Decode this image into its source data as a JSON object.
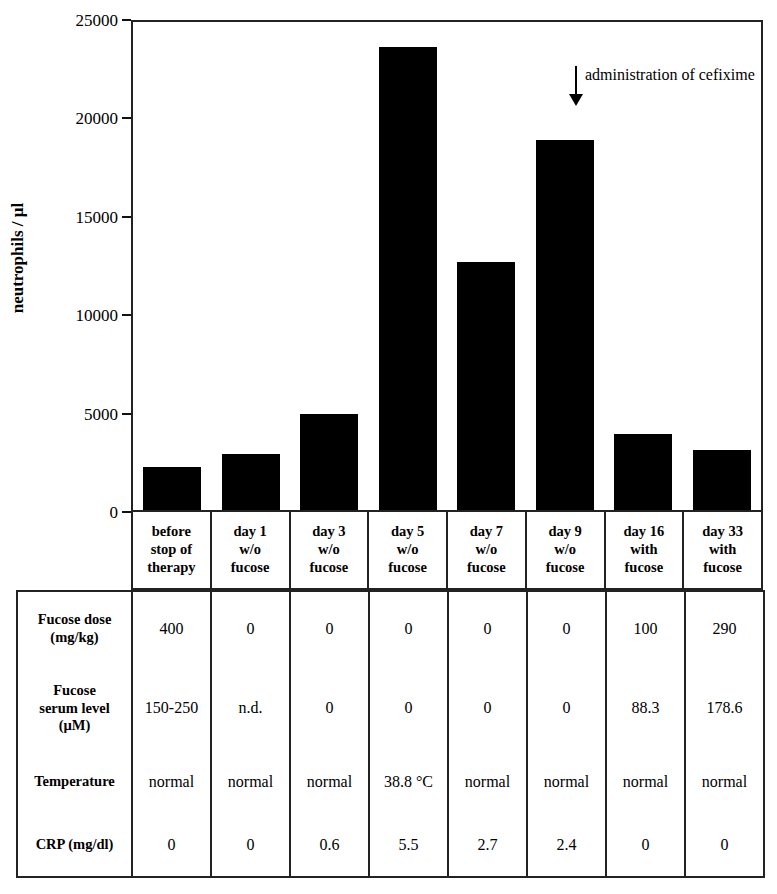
{
  "chart_data": {
    "type": "bar",
    "title": "",
    "xlabel": "",
    "ylabel": "neutrophils / µl",
    "ylim": [
      0,
      25000
    ],
    "ytick_labels": [
      "0",
      "5000",
      "10000",
      "15000",
      "20000",
      "25000"
    ],
    "yticks": [
      0,
      5000,
      10000,
      15000,
      20000,
      25000
    ],
    "grid": false,
    "legend": "none",
    "bar_color": "#000000",
    "categories": [
      "before stop of therapy",
      "day 1 w/o fucose",
      "day 3 w/o fucose",
      "day 5 w/o fucose",
      "day 7 w/o fucose",
      "day 9 w/o fucose",
      "day 16 with fucose",
      "day 33 with fucose"
    ],
    "values": [
      2200,
      2850,
      4900,
      23700,
      12700,
      18950,
      3900,
      3050
    ],
    "annotations": [
      {
        "text": "administration of cefixime",
        "marker": "down-arrow",
        "at_category": "day 5 w/o fucose"
      }
    ]
  },
  "axis": {
    "ylabel": "neutrophils / µl",
    "ticks": [
      {
        "value": 25000,
        "label": "25000"
      },
      {
        "value": 20000,
        "label": "20000"
      },
      {
        "value": 15000,
        "label": "15000"
      },
      {
        "value": 10000,
        "label": "10000"
      },
      {
        "value": 5000,
        "label": "5000"
      },
      {
        "value": 0,
        "label": "0"
      }
    ]
  },
  "annotation": {
    "text": "administration of cefixime"
  },
  "categories": [
    {
      "line1": "before",
      "line2": "stop of",
      "line3": "therapy"
    },
    {
      "line1": "day 1",
      "line2": "w/o",
      "line3": "fucose"
    },
    {
      "line1": "day 3",
      "line2": "w/o",
      "line3": "fucose"
    },
    {
      "line1": "day 5",
      "line2": "w/o",
      "line3": "fucose"
    },
    {
      "line1": "day 7",
      "line2": "w/o",
      "line3": "fucose"
    },
    {
      "line1": "day 9",
      "line2": "w/o",
      "line3": "fucose"
    },
    {
      "line1": "day 16",
      "line2": "with",
      "line3": "fucose"
    },
    {
      "line1": "day 33",
      "line2": "with",
      "line3": "fucose"
    }
  ],
  "table": {
    "row_labels": [
      {
        "line1": "Fucose dose",
        "line2": "(mg/kg)",
        "line3": ""
      },
      {
        "line1": "Fucose",
        "line2": "serum level",
        "line3": "(µM)"
      },
      {
        "line1": "Temperature",
        "line2": "",
        "line3": ""
      },
      {
        "line1": "CRP (mg/dl)",
        "line2": "",
        "line3": ""
      }
    ],
    "rows": [
      {
        "name": "Fucose dose (mg/kg)",
        "values": [
          "400",
          "0",
          "0",
          "0",
          "0",
          "0",
          "100",
          "290"
        ]
      },
      {
        "name": "Fucose serum level (µM)",
        "values": [
          "150-250",
          "n.d.",
          "0",
          "0",
          "0",
          "0",
          "88.3",
          "178.6"
        ]
      },
      {
        "name": "Temperature",
        "values": [
          "normal",
          "normal",
          "normal",
          "38.8 °C",
          "normal",
          "normal",
          "normal",
          "normal"
        ]
      },
      {
        "name": "CRP (mg/dl)",
        "values": [
          "0",
          "0",
          "0.6",
          "5.5",
          "2.7",
          "2.4",
          "0",
          "0"
        ]
      }
    ]
  }
}
